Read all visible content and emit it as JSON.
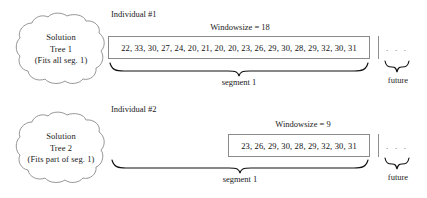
{
  "figure": {
    "rows": [
      {
        "id": "row-1",
        "tree": {
          "line1": "Solution",
          "line2": "Tree 1",
          "line3": "(Fits all seg. 1)"
        },
        "individual_label": "Individual #1",
        "windowsize_label": "Windowsize = 18",
        "windowsize_value": 18,
        "values": [
          22,
          33,
          30,
          27,
          24,
          20,
          21,
          20,
          20,
          23,
          26,
          29,
          30,
          28,
          29,
          32,
          30,
          31
        ],
        "values_text": "22, 33, 30, 27, 24, 20, 21, 20, 20, 23, 26, 29, 30, 28, 29, 32, 30, 31",
        "segment_label": "segment 1",
        "future_label": "future",
        "future_dots": ". . ."
      },
      {
        "id": "row-2",
        "tree": {
          "line1": "Solution",
          "line2": "Tree 2",
          "line3": "(Fits part of seg. 1)"
        },
        "individual_label": "Individual #2",
        "windowsize_label": "Windowsize = 9",
        "windowsize_value": 9,
        "values": [
          23,
          26,
          29,
          30,
          28,
          29,
          32,
          30,
          31
        ],
        "values_text": "23, 26, 29, 30, 28, 29, 32, 30, 31",
        "segment_label": "segment 1",
        "future_label": "future",
        "future_dots": ". . ."
      }
    ],
    "colors": {
      "stroke": "#8a8a8a",
      "text": "#1a1a1a",
      "brace": "#111111",
      "background": "#ffffff"
    }
  }
}
